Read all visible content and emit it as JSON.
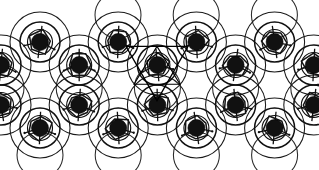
{
  "figure": {
    "width": 319,
    "height": 170,
    "background_color": "#ffffff"
  },
  "style": {
    "outline_color": "#1a1a1a",
    "core_color": "#111111",
    "polygon_color": "#141414",
    "marker_color": "#000000",
    "outer_radius": 30,
    "mid_radius": 20,
    "inner_radius": 12.5,
    "core_radius": 8.5,
    "empty_radius": 23
  },
  "lattice": {
    "type": "honeycomb",
    "column_spacing": 78.2,
    "row_offset": 39.1,
    "rows": [
      {
        "name": "row-top-empty",
        "y": 15,
        "filled": false,
        "x_start": 118,
        "count": 3,
        "step": 78.2
      },
      {
        "name": "row-1",
        "y": 42,
        "filled": true,
        "x_start": 40,
        "count": 4,
        "step": 78.2
      },
      {
        "name": "row-2",
        "y": 65,
        "filled": true,
        "x_start": 1,
        "count": 5,
        "step": 78.2
      },
      {
        "name": "row-mid-empty",
        "y": 88,
        "filled": false,
        "x_start": 1,
        "count": 5,
        "step": 78.2
      },
      {
        "name": "row-3",
        "y": 105,
        "filled": true,
        "x_start": 1,
        "count": 5,
        "step": 78.2
      },
      {
        "name": "row-4",
        "y": 128,
        "filled": true,
        "x_start": 40,
        "count": 4,
        "step": 78.2
      },
      {
        "name": "row-bottom-empty",
        "y": 155,
        "filled": false,
        "x_start": 40,
        "count": 4,
        "step": 78.2
      }
    ]
  },
  "highlight": {
    "label": "marked-cluster",
    "center_x": 157,
    "center_y": 65,
    "shape": "triangle",
    "orientation": "inverted",
    "size": 31,
    "has_inner_triangle": true
  },
  "legend": {
    "core_label": "core",
    "ring_label": "ring",
    "marker_label": "marker"
  }
}
